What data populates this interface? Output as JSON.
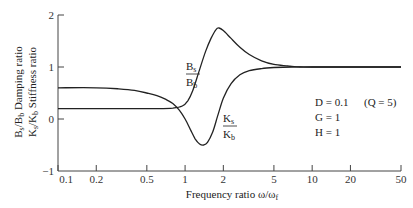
{
  "chart_data": {
    "type": "line",
    "title": "",
    "xlabel": "Frequency ratio ω/ω",
    "xlabel_subscript": "f",
    "ylabel_lines": [
      {
        "num": "B",
        "num_sub": "s",
        "den": "B",
        "den_sub": "b",
        "text": "Damping ratio"
      },
      {
        "num": "K",
        "num_sub": "s",
        "den": "K",
        "den_sub": "b",
        "text": "Stiffness ratio"
      }
    ],
    "x_scale": "log",
    "xlim": [
      0.1,
      50
    ],
    "ylim": [
      -1,
      2
    ],
    "x_ticks": [
      0.1,
      0.2,
      0.5,
      1,
      2,
      5,
      10,
      20,
      50
    ],
    "x_tick_labels": [
      "0.1",
      "0.2",
      "0.5",
      "1",
      "2",
      "5",
      "10",
      "20",
      "50"
    ],
    "y_ticks": [
      -1,
      0,
      1,
      2
    ],
    "y_tick_labels": [
      "−1",
      "0",
      "1",
      "2"
    ],
    "grid": false,
    "series": [
      {
        "name": "Bs/Bb",
        "label_num": "B",
        "label_num_sub": "s",
        "label_den": "B",
        "label_den_sub": "b",
        "x": [
          0.1,
          0.3,
          0.6,
          0.8,
          0.95,
          1.05,
          1.15,
          1.3,
          1.45,
          1.6,
          1.75,
          1.85,
          2.0,
          2.3,
          2.7,
          3.2,
          4.0,
          5.0,
          6.5,
          8.0,
          10,
          20,
          50
        ],
        "values": [
          0.2,
          0.2,
          0.2,
          0.21,
          0.25,
          0.35,
          0.55,
          0.95,
          1.3,
          1.55,
          1.72,
          1.75,
          1.7,
          1.55,
          1.38,
          1.24,
          1.12,
          1.05,
          1.02,
          1.0,
          1.0,
          1.0,
          1.0
        ]
      },
      {
        "name": "Ks/Kb",
        "label_num": "K",
        "label_num_sub": "s",
        "label_den": "K",
        "label_den_sub": "b",
        "x": [
          0.1,
          0.2,
          0.3,
          0.4,
          0.5,
          0.6,
          0.7,
          0.8,
          0.9,
          1.0,
          1.1,
          1.2,
          1.3,
          1.4,
          1.5,
          1.65,
          1.8,
          2.0,
          2.3,
          2.7,
          3.2,
          4.0,
          5.0,
          7.0,
          10,
          20,
          50
        ],
        "values": [
          0.6,
          0.6,
          0.58,
          0.55,
          0.5,
          0.45,
          0.38,
          0.3,
          0.17,
          0.0,
          -0.2,
          -0.38,
          -0.48,
          -0.5,
          -0.45,
          -0.25,
          0.05,
          0.4,
          0.68,
          0.85,
          0.93,
          0.97,
          0.99,
          1.0,
          1.0,
          1.0,
          1.0
        ]
      }
    ],
    "annotations": [
      {
        "text": "D = 0.1",
        "extra": "(Q = 5)"
      },
      {
        "text": "G = 1"
      },
      {
        "text": "H = 1"
      }
    ]
  }
}
